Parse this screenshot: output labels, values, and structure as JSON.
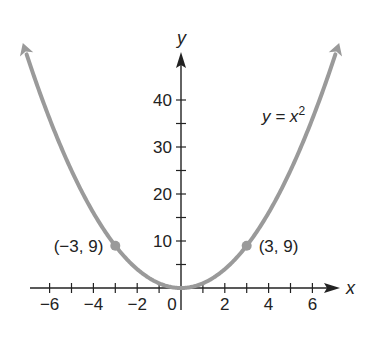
{
  "chart_data": {
    "type": "line",
    "title": "",
    "function": "y = x^2",
    "xlabel": "x",
    "ylabel": "y",
    "xlim": [
      -6.5,
      7
    ],
    "ylim": [
      0,
      50
    ],
    "x_ticks": [
      -6,
      -5,
      -4,
      -3,
      -2,
      -1,
      1,
      2,
      3,
      4,
      5,
      6
    ],
    "x_tick_labels": [
      "−6",
      "−4",
      "−2",
      "0",
      "2",
      "4",
      "6"
    ],
    "x_tick_label_values": [
      -6,
      -4,
      -2,
      0,
      2,
      4,
      6
    ],
    "y_ticks": [
      5,
      10,
      15,
      20,
      25,
      30,
      35,
      40
    ],
    "y_tick_labels": [
      "10",
      "20",
      "30",
      "40"
    ],
    "y_tick_label_values": [
      10,
      20,
      30,
      40
    ],
    "grid": false,
    "series": [
      {
        "name": "y = x²",
        "x": [
          -7,
          -6,
          -5,
          -4,
          -3,
          -2,
          -1,
          0,
          1,
          2,
          3,
          4,
          5,
          6,
          7
        ],
        "y": [
          49,
          36,
          25,
          16,
          9,
          4,
          1,
          0,
          1,
          4,
          9,
          16,
          25,
          36,
          49
        ],
        "color": "#9a9a9a",
        "arrows_at_ends": true
      }
    ],
    "points": [
      {
        "x": -3,
        "y": 9,
        "label": "(−3, 9)"
      },
      {
        "x": 3,
        "y": 9,
        "label": "(3, 9)"
      }
    ],
    "annotations": [
      {
        "text": "y = x",
        "superscript": "2",
        "near": [
          5,
          40
        ]
      }
    ]
  },
  "colors": {
    "curve": "#9a9a9a",
    "axis": "#222222"
  }
}
